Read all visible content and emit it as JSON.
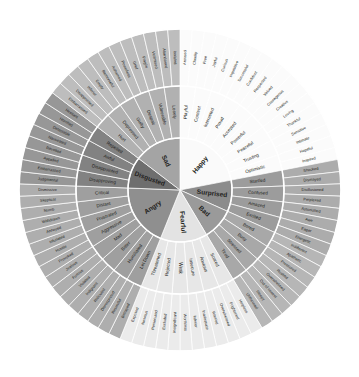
{
  "figure": {
    "type": "radial-hierarchy",
    "background_color": "#ffffff",
    "divider_color": "#ffffff",
    "text_color": "#231f20",
    "center": {
      "x": 180,
      "y": 190
    },
    "radii": {
      "core": 52,
      "middle": 104,
      "outer": 161
    },
    "start_angle_deg": -90,
    "rings": [
      "core",
      "middle",
      "outer"
    ]
  },
  "wheel": {
    "core_labels": [
      "Happy",
      "Surprised",
      "Bad",
      "Fearful",
      "Angry",
      "Disgusted",
      "Sad"
    ],
    "sectors": [
      {
        "core": "Happy",
        "color": "#fafafa",
        "children": [
          {
            "middle": "Playful",
            "outer": [
              "Aroused",
              "Cheeky"
            ]
          },
          {
            "middle": "Content",
            "outer": [
              "Free",
              "Joyful"
            ]
          },
          {
            "middle": "Interested",
            "outer": [
              "Curious",
              "Inquisitive"
            ]
          },
          {
            "middle": "Proud",
            "outer": [
              "Successful",
              "Confident"
            ]
          },
          {
            "middle": "Accepted",
            "outer": [
              "Respected",
              "Valued"
            ]
          },
          {
            "middle": "Powerful",
            "outer": [
              "Courageous",
              "Creative"
            ]
          },
          {
            "middle": "Peaceful",
            "outer": [
              "Loving",
              "Thankful"
            ]
          },
          {
            "middle": "Trusting",
            "outer": [
              "Sensitive",
              "Intimate"
            ]
          },
          {
            "middle": "Optimistic",
            "outer": [
              "Hopeful",
              "Inspired"
            ]
          }
        ]
      },
      {
        "core": "Surprised",
        "color": "#8c8c8c",
        "children": [
          {
            "middle": "Startled",
            "outer": [
              "Shocked",
              "Dismayed"
            ]
          },
          {
            "middle": "Confused",
            "outer": [
              "Disillusioned",
              "Perplexed"
            ]
          },
          {
            "middle": "Amazed",
            "outer": [
              "Astonished",
              "Awe"
            ]
          },
          {
            "middle": "Excited",
            "outer": [
              "Eager",
              "Energetic"
            ]
          }
        ]
      },
      {
        "core": "Bad",
        "color": "#9a9a9a",
        "children": [
          {
            "middle": "Bored",
            "outer": [
              "Indifferent",
              "Apathetic"
            ]
          },
          {
            "middle": "Busy",
            "outer": [
              "Pressured",
              "Rushed"
            ]
          },
          {
            "middle": "Stressed",
            "outer": [
              "Overwhelmed",
              "Out of control"
            ]
          },
          {
            "middle": "Tired",
            "outer": [
              "Sleepy",
              "Unfocused"
            ]
          }
        ]
      },
      {
        "core": "Fearful",
        "color": "#e3e3e3",
        "children": [
          {
            "middle": "Scared",
            "outer": [
              "Helpless",
              "Frightened"
            ]
          },
          {
            "middle": "Anxious",
            "outer": [
              "Overwhelmed",
              "Worried"
            ]
          },
          {
            "middle": "Insecure",
            "outer": [
              "Inadequate",
              "Inferior"
            ]
          },
          {
            "middle": "Weak",
            "outer": [
              "Worthless",
              "Insignificant"
            ]
          },
          {
            "middle": "Rejected",
            "outer": [
              "Excluded",
              "Persecuted"
            ]
          },
          {
            "middle": "Threatened",
            "outer": [
              "Nervous",
              "Exposed"
            ]
          }
        ]
      },
      {
        "core": "Angry",
        "color": "#8f8f8f",
        "children": [
          {
            "middle": "Let Down",
            "outer": [
              "Betrayed",
              "Resentful"
            ]
          },
          {
            "middle": "Humiliated",
            "outer": [
              "Disrespected",
              "Ridiculed"
            ]
          },
          {
            "middle": "Bitter",
            "outer": [
              "Indignant",
              "Violated"
            ]
          },
          {
            "middle": "Mad",
            "outer": [
              "Furious",
              "Jealous"
            ]
          },
          {
            "middle": "Aggressive",
            "outer": [
              "Provoked",
              "Hostile"
            ]
          },
          {
            "middle": "Frustrated",
            "outer": [
              "Infuriated",
              "Annoyed"
            ]
          },
          {
            "middle": "Distant",
            "outer": [
              "Withdrawn",
              "Numb"
            ]
          },
          {
            "middle": "Critical",
            "outer": [
              "Skeptical",
              "Dismissive"
            ]
          }
        ]
      },
      {
        "core": "Disgusted",
        "color": "#6e6e6e",
        "children": [
          {
            "middle": "Disapproving",
            "outer": [
              "Judgmental",
              "Embarrassed"
            ]
          },
          {
            "middle": "Disappointed",
            "outer": [
              "Appalled",
              "Revolted"
            ]
          },
          {
            "middle": "Awful",
            "outer": [
              "Nauseated",
              "Detestable"
            ]
          },
          {
            "middle": "Repelled",
            "outer": [
              "Horrified",
              "Hesitant"
            ]
          }
        ]
      },
      {
        "core": "Sad",
        "color": "#a4a4a4",
        "children": [
          {
            "middle": "Hurt",
            "outer": [
              "Embarrassed",
              "Disappointed"
            ]
          },
          {
            "middle": "Depressed",
            "outer": [
              "Inferior",
              "Empty"
            ]
          },
          {
            "middle": "Guilty",
            "outer": [
              "Remorseful",
              "Ashamed"
            ]
          },
          {
            "middle": "Despair",
            "outer": [
              "Powerless",
              "Grief"
            ]
          },
          {
            "middle": "Vulnerable",
            "outer": [
              "Fragile",
              "Victimised"
            ]
          },
          {
            "middle": "Lonely",
            "outer": [
              "Abandoned",
              "Isolated"
            ]
          }
        ]
      }
    ]
  }
}
